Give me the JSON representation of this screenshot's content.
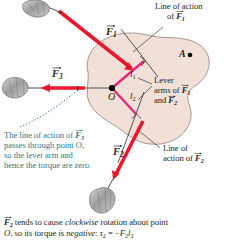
{
  "figure": {
    "body_fill": "#f2e0d8",
    "body_stroke": "#9b8b84",
    "force_color": "#e8192c",
    "lever_color": "#e3227a",
    "note_color": "#1f7a8c",
    "line_color": "#231f20"
  },
  "labels": {
    "force1": "F",
    "force1_sub": "1",
    "force2": "F",
    "force2_sub": "2",
    "force3": "F",
    "force3_sub": "3",
    "point_a": "A",
    "point_o": "O",
    "lever_arm1": "l",
    "lever_arm1_sub": "1",
    "lever_arm2": "l",
    "lever_arm2_sub": "2"
  },
  "callouts": {
    "line_of_action_f1": {
      "line1": "Line of action",
      "line2_prefix": "of ",
      "line2_symbol": "F",
      "line2_sub": "1"
    },
    "lever_arms": {
      "line1": "Lever",
      "line2_prefix": "arms of ",
      "line2_symbol": "F",
      "line2_sub": "1",
      "line3_prefix": "and ",
      "line3_symbol": "F",
      "line3_sub": "2"
    },
    "line_of_action_f2": {
      "line1": "Line of",
      "line2_prefix": "action of ",
      "line2_symbol": "F",
      "line2_sub": "2"
    }
  },
  "note": {
    "line1_prefix": "The line of action of ",
    "line1_symbol": "F",
    "line1_sub": "3",
    "line2": "passes through point O,",
    "line3": "so the lever arm and",
    "line4": "hence the torque are zero."
  },
  "caption": {
    "symbol": "F",
    "symbol_sub": "2",
    "part1": " tends to cause ",
    "emphasis1": "clockwise",
    "part2": " rotation about point",
    "line2_o": "O",
    "line2_mid": ", so its torque is ",
    "emphasis2": "negative",
    "line2_colon": ": ",
    "tau": "τ",
    "tau_sub": "2",
    "equals": " = ",
    "minus": "−",
    "term_f": "F",
    "term_f_sub": "2",
    "term_l": "l",
    "term_l_sub": "2"
  }
}
